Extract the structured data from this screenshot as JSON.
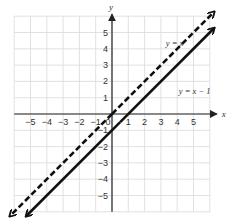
{
  "chart_data": {
    "type": "line",
    "title": "",
    "xlabel": "x",
    "ylabel": "y",
    "xlim": [
      -6,
      6
    ],
    "ylim": [
      -6,
      6
    ],
    "grid": true,
    "x_ticks": [
      "−5",
      "−4",
      "−3",
      "−2",
      "−1",
      "0",
      "1",
      "2",
      "3",
      "4",
      "5"
    ],
    "y_ticks": [
      "5",
      "4",
      "3",
      "2",
      "1",
      "−1",
      "−2",
      "−3",
      "−4",
      "−5"
    ],
    "series": [
      {
        "name": "y = x",
        "style": "dashed",
        "slope": 1,
        "intercept": 0,
        "x": [
          -6,
          6
        ],
        "y": [
          -6,
          6
        ],
        "color": "#111111"
      },
      {
        "name": "y = x − 1",
        "style": "solid",
        "slope": 1,
        "intercept": -1,
        "x": [
          -5,
          6
        ],
        "y": [
          -6,
          5
        ],
        "color": "#111111"
      }
    ],
    "annotations": [
      {
        "text": "y = x",
        "x": 3.3,
        "y": 4.2
      },
      {
        "text": "y = x − 1",
        "x": 4.1,
        "y": 1.2
      }
    ]
  }
}
